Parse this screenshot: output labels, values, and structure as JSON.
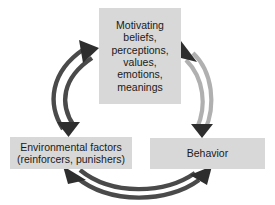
{
  "diagram": {
    "background_color": "#ffffff",
    "box_fill_color": "#d8d8d8",
    "text_color": "#1a1a1a",
    "arrow_dark_color": "#4a4a4a",
    "arrow_light_color": "#b0b0b0",
    "arrowhead_color": "#2e2e2e",
    "nodes": [
      {
        "id": "motivating",
        "label": "Motivating\nbeliefs,\nperceptions,\nvalues,\nemotions,\nmeanings",
        "position": "top"
      },
      {
        "id": "environment",
        "label": "Environmental factors\n(reinforcers, punishers)",
        "position": "bottom-left"
      },
      {
        "id": "behavior",
        "label": "Behavior",
        "position": "bottom-right"
      }
    ],
    "connectors": [
      {
        "id": "motivating-environment",
        "from": "motivating",
        "to": "environment",
        "style": "double-headed-curved",
        "shade": "dark"
      },
      {
        "id": "motivating-behavior",
        "from": "motivating",
        "to": "behavior",
        "style": "double-headed-curved",
        "shade": "light"
      },
      {
        "id": "environment-behavior",
        "from": "environment",
        "to": "behavior",
        "style": "double-headed-curved",
        "shade": "dark"
      }
    ]
  }
}
